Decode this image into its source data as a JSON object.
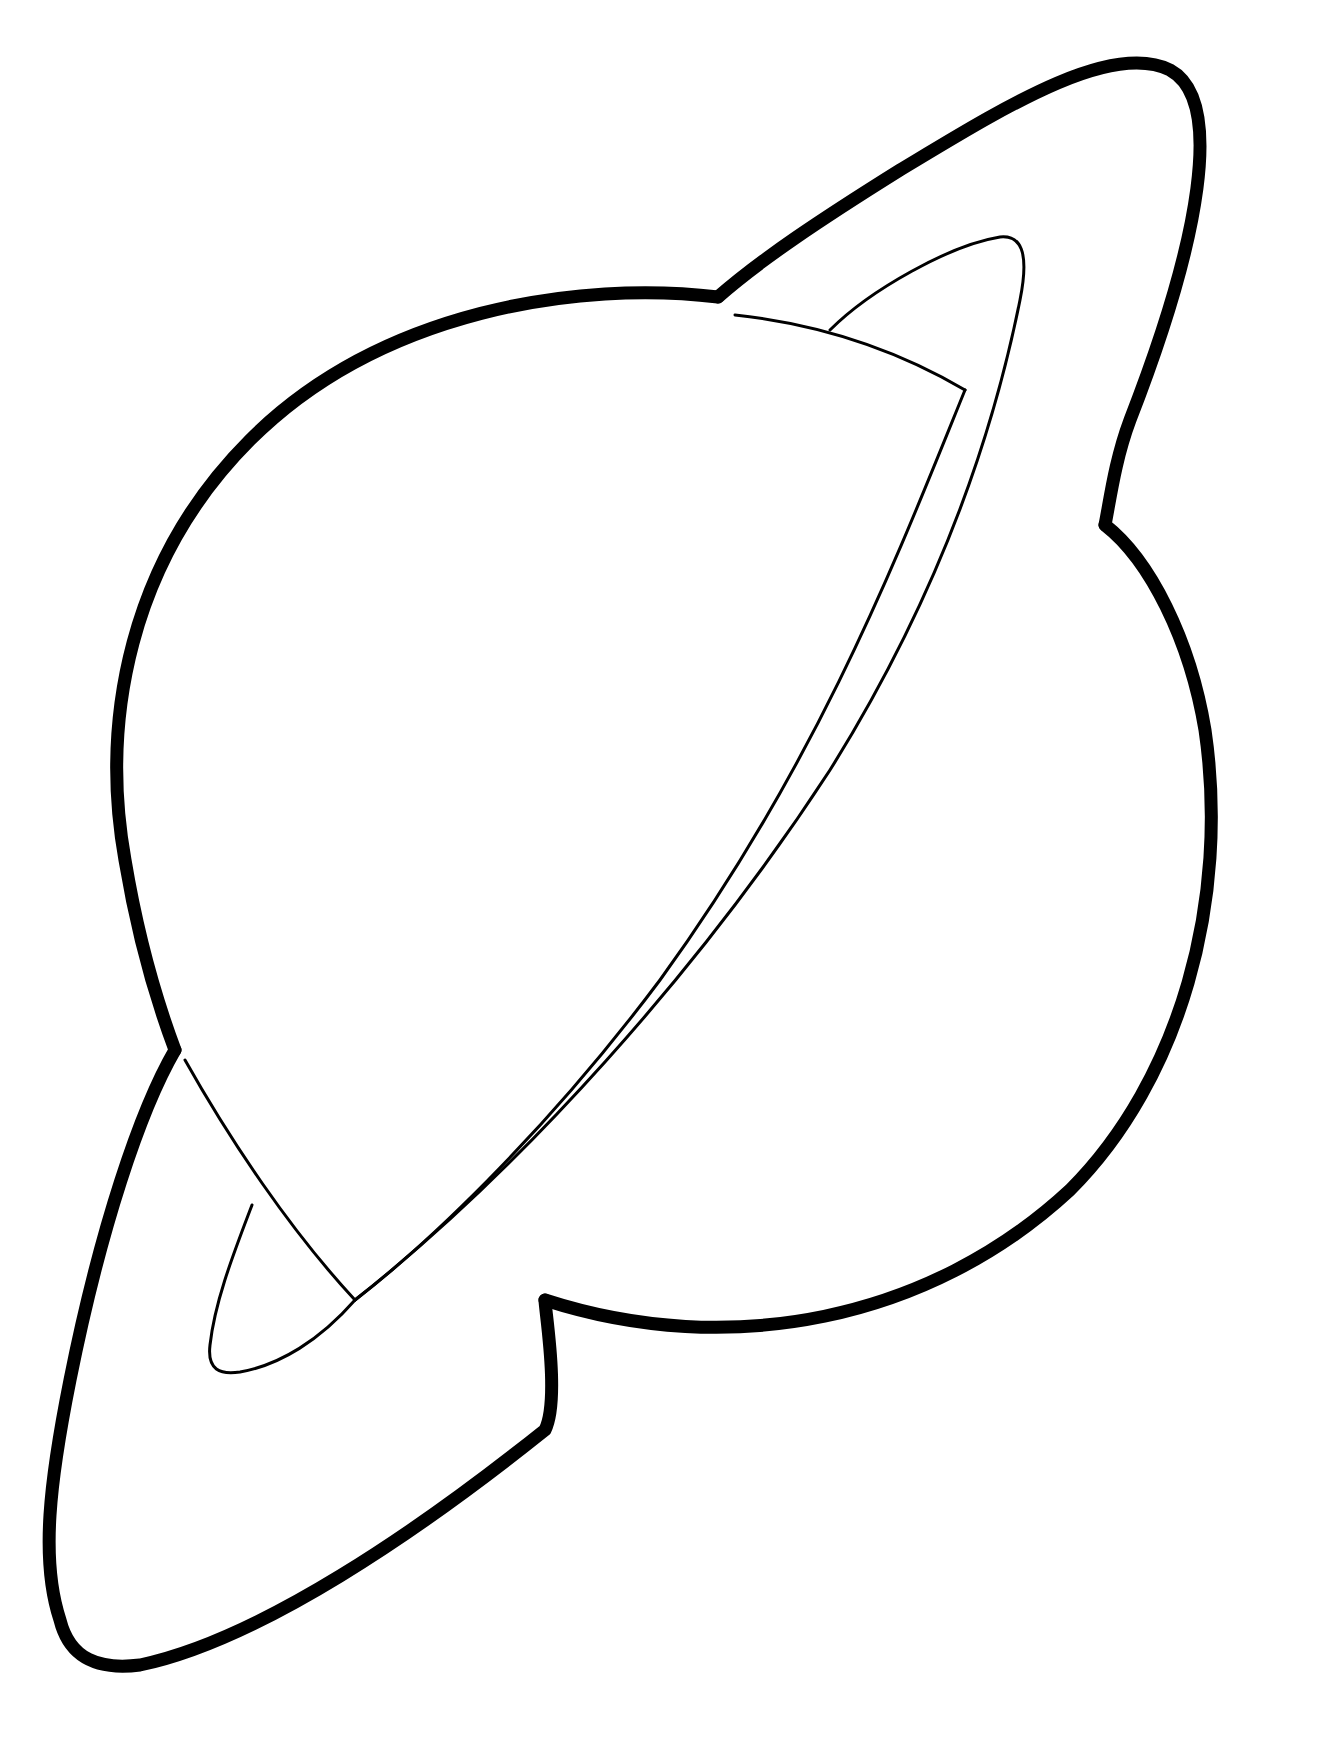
{
  "image": {
    "subject": "Ringed planet coloring page outline",
    "style": "black line art on white background",
    "colors": {
      "background": "#ffffff",
      "line": "#000000"
    },
    "elements": [
      {
        "name": "planet-body",
        "description": "large circle outline"
      },
      {
        "name": "planet-ring",
        "description": "tilted elliptical ring band crossing planet diagonally"
      }
    ]
  }
}
